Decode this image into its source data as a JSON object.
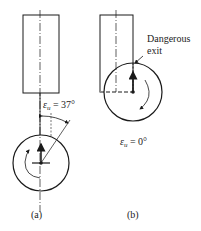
{
  "figure": {
    "panel_a": {
      "caption": "(a)",
      "angle_label_symbol": "ε",
      "angle_label_sub": "u",
      "angle_label_value": " = 37°"
    },
    "panel_b": {
      "caption": "(b)",
      "annotation_line1": "Dangerous",
      "annotation_line2": "exit",
      "angle_label_symbol": "ε",
      "angle_label_sub": "u",
      "angle_label_value": " = 0°"
    }
  },
  "colors": {
    "stroke": "#1a1a1a",
    "background": "#ffffff"
  }
}
